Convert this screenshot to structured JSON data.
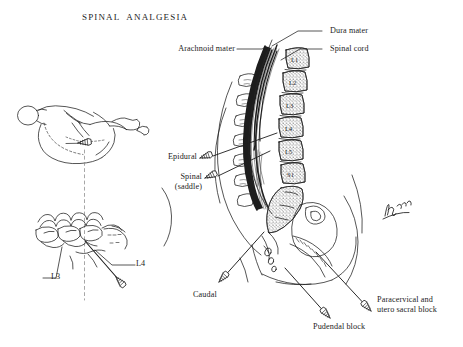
{
  "figure": {
    "title": "SPINAL  ANALGESIA",
    "background_color": "#ffffff",
    "ink_color": "#1d1d1d",
    "signature": "Pomeroy"
  },
  "labels": {
    "dura_mater": "Dura mater",
    "spinal_cord": "Spinal cord",
    "arachnoid_mater": "Arachnoid mater",
    "epidural": "Epidural",
    "spinal_saddle_line1": "Spinal",
    "spinal_saddle_line2": "(saddle)",
    "caudal": "Caudal",
    "pudendal_block": "Pudendal block",
    "paracervical_line1": "Paracervical and",
    "paracervical_line2": "utero sacral block",
    "l3": "L3",
    "l4": "L4"
  },
  "vertebrae": [
    {
      "id": "L1",
      "label": "L1"
    },
    {
      "id": "L2",
      "label": "L2"
    },
    {
      "id": "L3",
      "label": "L3"
    },
    {
      "id": "L4",
      "label": "L4"
    },
    {
      "id": "L5",
      "label": "L5"
    },
    {
      "id": "S1",
      "label": "S1"
    }
  ],
  "panels": {
    "patient_position": "lateral-decubitus-patient",
    "lumbar_vertebrae": "lumbar-vertebrae-lateral-view",
    "sagittal_pelvis": "sagittal-spine-and-pelvis"
  },
  "needles": [
    {
      "name": "epidural-needle"
    },
    {
      "name": "spinal-saddle-needle"
    },
    {
      "name": "caudal-needle"
    },
    {
      "name": "pudendal-needle"
    },
    {
      "name": "paracervical-needle"
    },
    {
      "name": "lumbar-puncture-needle"
    },
    {
      "name": "patient-position-needle"
    }
  ]
}
